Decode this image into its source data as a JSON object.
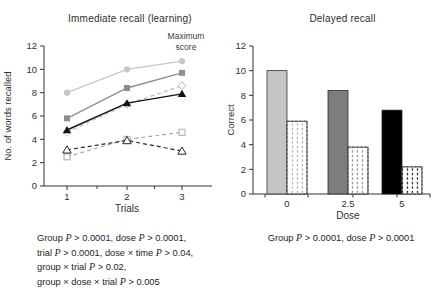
{
  "figure": {
    "left_panel_title": "Immediate recall (learning)",
    "right_panel_title": "Delayed recall",
    "max_score_annotation": "Maximum score"
  },
  "chart_data": [
    {
      "type": "line",
      "title": "Immediate recall (learning)",
      "xlabel": "Trials",
      "ylabel": "No. of words recalled",
      "x": [
        1,
        2,
        3
      ],
      "xticklabels": [
        "1",
        "2",
        "3"
      ],
      "ylim": [
        0,
        12
      ],
      "yticks": [
        0,
        2,
        4,
        6,
        8,
        10,
        12
      ],
      "grid": false,
      "legend": "none",
      "annotation": "Maximum score",
      "series": [
        {
          "name": "light-gray-solid-filled-circle",
          "values": [
            8.0,
            10.0,
            10.7
          ],
          "color": "#c7c7c7",
          "dash": "solid",
          "marker": "circle-filled"
        },
        {
          "name": "gray-solid-filled-square",
          "values": [
            5.8,
            8.4,
            9.7
          ],
          "color": "#8e8e8e",
          "dash": "solid",
          "marker": "square-filled"
        },
        {
          "name": "light-gray-dashed-open-diamond",
          "values": [
            4.6,
            7.0,
            8.6
          ],
          "color": "#bcbcbc",
          "dash": "dashed",
          "marker": "diamond-open"
        },
        {
          "name": "black-solid-filled-triangle",
          "values": [
            4.8,
            7.1,
            7.9
          ],
          "color": "#141414",
          "dash": "solid",
          "marker": "triangle-filled"
        },
        {
          "name": "light-gray-dashed-open-square",
          "values": [
            2.5,
            4.0,
            4.6
          ],
          "color": "#a9a9a9",
          "dash": "dashed",
          "marker": "square-open"
        },
        {
          "name": "black-dashed-open-triangle",
          "values": [
            3.1,
            3.9,
            3.0
          ],
          "color": "#262626",
          "dash": "dashed",
          "marker": "triangle-open"
        }
      ],
      "stats_lines": [
        "Group P > 0.0001, dose P > 0.0001,",
        "trial P > 0.0001, dose × time P > 0.04,",
        "group × trial P > 0.02,",
        "group × dose × trial P > 0.005"
      ]
    },
    {
      "type": "bar",
      "title": "Delayed recall",
      "xlabel": "Dose",
      "ylabel": "Correct",
      "categories": [
        "0",
        "2.5",
        "5"
      ],
      "ylim": [
        0,
        12
      ],
      "yticks": [
        0,
        2,
        4,
        6,
        8,
        10,
        12
      ],
      "grid": false,
      "legend": "none",
      "series": [
        {
          "name": "solid-bars",
          "values": [
            10.0,
            8.4,
            6.8
          ],
          "fill_colors": [
            "#c5c5c5",
            "#7d7d7d",
            "#000000"
          ]
        },
        {
          "name": "dotted-bars",
          "values": [
            5.9,
            3.8,
            2.2
          ],
          "fill": "#ffffff",
          "pattern": "vertical-dots",
          "pattern_colors": [
            "#b4b4b4",
            "#8f8f8f",
            "#2a2a2a"
          ]
        }
      ],
      "stats_lines": [
        "Group P > 0.0001, dose P > 0.0001"
      ]
    }
  ],
  "colors": {
    "axis": "#333333",
    "tick_text": "#2e2e2e",
    "annotation_text": "#3d3d3d"
  }
}
